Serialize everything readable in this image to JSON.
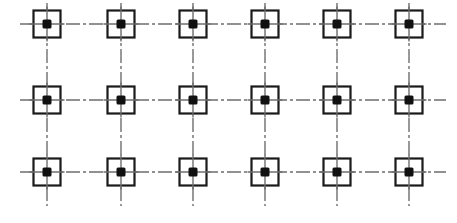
{
  "figure": {
    "background_color": "#ffffff",
    "width": 457,
    "height": 223,
    "alt_text": "Six by three array of open squares, each with a solid black dot at its center, linked by dash-dot centerlines running horizontally and vertically"
  },
  "style": {
    "line_color": "#6e6e6e",
    "square_stroke_color": "#1a1a1a",
    "square_fill_color": "#ffffff",
    "dot_color": "#111111",
    "square_stroke_width": 2.2,
    "centerline_width": 1.4,
    "centerline_dash": "14 3 3 3",
    "square_size": 27,
    "dot_size": 9,
    "dot_corner_radius": 1.5
  },
  "geometry": {
    "columns_x": [
      47,
      121,
      193,
      265,
      337,
      409
    ],
    "rows_y": [
      24,
      100,
      172
    ],
    "column_count": 6,
    "row_count": 3,
    "cell_count": 18,
    "column_pitch": 72,
    "row_pitch_top": 76,
    "row_pitch_bottom": 72,
    "horizontal_line_start_x": 20,
    "horizontal_line_end_x": 446,
    "vertical_line_start_y": 3,
    "vertical_line_end_y": 206
  },
  "chart_data": {
    "type": "scatter",
    "xlabel": "",
    "ylabel": "",
    "grid": true,
    "legend": "none",
    "xlim": [
      0,
      457
    ],
    "ylim": [
      0,
      223
    ],
    "categories": [
      "C1",
      "C2",
      "C3",
      "C4",
      "C5",
      "C6"
    ],
    "row_labels": [
      "R1",
      "R2",
      "R3"
    ],
    "x": [
      47,
      121,
      193,
      265,
      337,
      409
    ],
    "y": [
      24,
      100,
      172
    ],
    "points": [
      {
        "id": "R1C1",
        "x": 47,
        "y": 24,
        "marker": "square-with-dot"
      },
      {
        "id": "R1C2",
        "x": 121,
        "y": 24,
        "marker": "square-with-dot"
      },
      {
        "id": "R1C3",
        "x": 193,
        "y": 24,
        "marker": "square-with-dot"
      },
      {
        "id": "R1C4",
        "x": 265,
        "y": 24,
        "marker": "square-with-dot"
      },
      {
        "id": "R1C5",
        "x": 337,
        "y": 24,
        "marker": "square-with-dot"
      },
      {
        "id": "R1C6",
        "x": 409,
        "y": 24,
        "marker": "square-with-dot"
      },
      {
        "id": "R2C1",
        "x": 47,
        "y": 100,
        "marker": "square-with-dot"
      },
      {
        "id": "R2C2",
        "x": 121,
        "y": 100,
        "marker": "square-with-dot"
      },
      {
        "id": "R2C3",
        "x": 193,
        "y": 100,
        "marker": "square-with-dot"
      },
      {
        "id": "R2C4",
        "x": 265,
        "y": 100,
        "marker": "square-with-dot"
      },
      {
        "id": "R2C5",
        "x": 337,
        "y": 100,
        "marker": "square-with-dot"
      },
      {
        "id": "R2C6",
        "x": 409,
        "y": 100,
        "marker": "square-with-dot"
      },
      {
        "id": "R3C1",
        "x": 47,
        "y": 172,
        "marker": "square-with-dot"
      },
      {
        "id": "R3C2",
        "x": 121,
        "y": 172,
        "marker": "square-with-dot"
      },
      {
        "id": "R3C3",
        "x": 193,
        "y": 172,
        "marker": "square-with-dot"
      },
      {
        "id": "R3C4",
        "x": 265,
        "y": 172,
        "marker": "square-with-dot"
      },
      {
        "id": "R3C5",
        "x": 337,
        "y": 172,
        "marker": "square-with-dot"
      },
      {
        "id": "R3C6",
        "x": 409,
        "y": 172,
        "marker": "square-with-dot"
      }
    ],
    "gridlines": {
      "horizontal_y": [
        24,
        100,
        172
      ],
      "vertical_x": [
        47,
        121,
        193,
        265,
        337,
        409
      ],
      "style": "dash-dot centerline"
    }
  }
}
